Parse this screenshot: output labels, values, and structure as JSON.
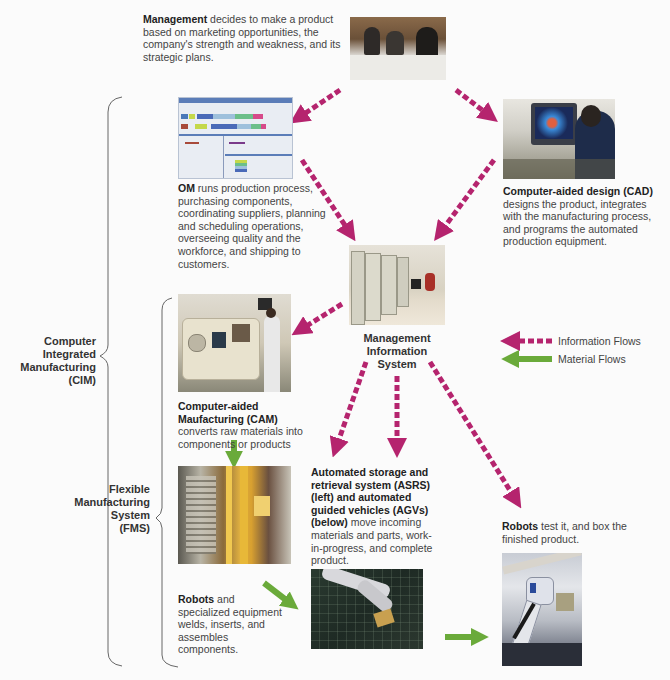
{
  "diagram": {
    "management": {
      "bold": "Management",
      "text": " decides to make a product based on marketing opportunities, the company's strength and weakness, and its strategic plans.",
      "image": "meeting-photo"
    },
    "om": {
      "bold": "OM",
      "text": " runs production process, purchasing components, coordinating suppliers, planning and scheduling operations, overseeing quality and the workforce, and shipping to customers.",
      "image": "scheduling-software-screenshot"
    },
    "cad": {
      "bold": "Computer-aided design (CAD)",
      "text": " designs the product, integrates with the manufacturing process, and programs the automated production equipment.",
      "image": "cad-workstation-photo"
    },
    "mis": {
      "line1": "Management",
      "line2": "Information",
      "line3": "System",
      "image": "server-room-photo"
    },
    "cam": {
      "bold": "Computer-aided Maufacturing (CAM)",
      "text": " converts raw materials into components or products",
      "image": "cnc-machine-photo"
    },
    "asrs": {
      "bold": "Automated storage and retrieval system (ASRS) (left) and automated guided vehicles (AGVs) (below)",
      "text": " move incoming materials and parts, work-in-progress, and complete product.",
      "image": "asrs-warehouse-photo"
    },
    "robots_assemble": {
      "bold": "Robots",
      "text": " and specialized equipment welds, inserts, and assembles components.",
      "image": "robot-arm-photo"
    },
    "robots_test": {
      "bold": "Robots",
      "text": " test it, and box the finished product.",
      "image": "robot-packaging-photo"
    },
    "brackets": {
      "cim": [
        "Computer",
        "Integrated",
        "Manufacturing",
        "(CIM)"
      ],
      "fms": [
        "Flexible",
        "Manufacturing",
        "System",
        "(FMS)"
      ]
    },
    "legend": {
      "information": "Information Flows",
      "material": "Material Flows"
    },
    "colors": {
      "information_flow": "#b5246e",
      "material_flow": "#6aaa3a",
      "bracket": "#666666"
    }
  }
}
